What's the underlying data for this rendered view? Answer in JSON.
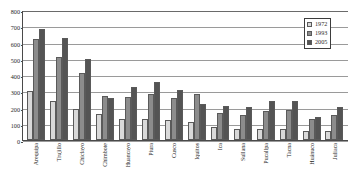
{
  "chart_data": {
    "type": "bar",
    "title": "",
    "xlabel": "",
    "ylabel": "",
    "ylim": [
      0,
      800
    ],
    "ytick_step": 100,
    "yticks": [
      800,
      700,
      600,
      500,
      400,
      300,
      200,
      100,
      0
    ],
    "grid": true,
    "legend_position": "top-right",
    "categories": [
      "Arequipa",
      "Trujillo",
      "Chiclayo",
      "Chimbote",
      "Huancayo",
      "Piura",
      "Cusco",
      "Iquitos",
      "Ica",
      "Sullana",
      "Pucallpa",
      "Tacna",
      "Huánuco",
      "Juliaca"
    ],
    "series": [
      {
        "name": "1972",
        "color": "#d9d9d9",
        "values": [
          300,
          240,
          190,
          160,
          130,
          130,
          125,
          113,
          78,
          68,
          70,
          67,
          58,
          54
        ]
      },
      {
        "name": "1993",
        "color": "#8c8c8c",
        "values": [
          620,
          512,
          414,
          273,
          263,
          283,
          257,
          281,
          168,
          155,
          181,
          187,
          130,
          156
        ]
      },
      {
        "name": "2005",
        "color": "#545454",
        "values": [
          683,
          625,
          499,
          257,
          327,
          360,
          310,
          220,
          211,
          201,
          242,
          242,
          140,
          204
        ]
      }
    ]
  },
  "legend": {
    "entries": [
      {
        "label": "1972",
        "swatch": "legend-swatch-1972"
      },
      {
        "label": "1993",
        "swatch": "legend-swatch-1993"
      },
      {
        "label": "2005",
        "swatch": "legend-swatch-2005"
      }
    ]
  },
  "colors": {
    "series_1972": "#d9d9d9",
    "series_1993": "#8c8c8c",
    "series_2005": "#545454",
    "axis": "#4a4a4a",
    "grid": "#9a9a9a",
    "background": "#ffffff"
  }
}
